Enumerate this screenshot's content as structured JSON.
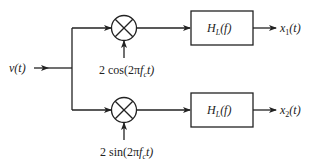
{
  "diagram": {
    "type": "block-diagram",
    "input": {
      "label": "v(t)"
    },
    "branches": [
      {
        "id": "top",
        "mixer": {
          "symbol": "multiplier",
          "oscillator_label": "2 cos(2πf_c t)",
          "oscillator_text": {
            "pre": "2 cos(2π",
            "f": "f",
            "sub": "c",
            "post": "t)"
          }
        },
        "filter": {
          "label": "H_L(f)",
          "text": {
            "H": "H",
            "sub": "L",
            "post": "(f)"
          }
        },
        "output": {
          "label": "x_1(t)",
          "text": {
            "x": "x",
            "sub": "1",
            "post": "(t)"
          }
        }
      },
      {
        "id": "bottom",
        "mixer": {
          "symbol": "multiplier",
          "oscillator_label": "2 sin(2πf_c t)",
          "oscillator_text": {
            "pre": "2 sin(2π",
            "f": "f",
            "sub": "c",
            "post": "t)"
          }
        },
        "filter": {
          "label": "H_L(f)",
          "text": {
            "H": "H",
            "sub": "L",
            "post": "(f)"
          }
        },
        "output": {
          "label": "x_2(t)",
          "text": {
            "x": "x",
            "sub": "2",
            "post": "(t)"
          }
        }
      }
    ],
    "colors": {
      "line": "#222222",
      "background": "#ffffff"
    }
  }
}
